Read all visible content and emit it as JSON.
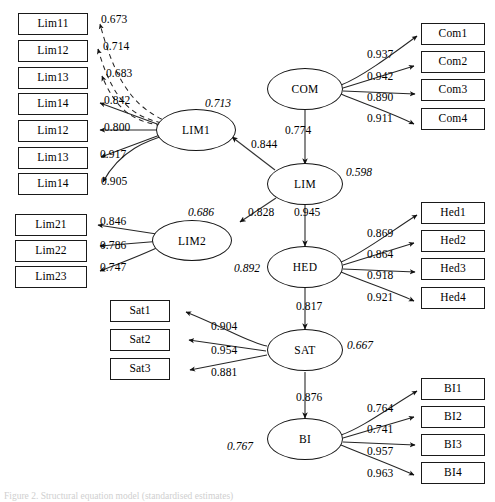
{
  "figure": {
    "type": "structural-equation-model",
    "caption": "Figure 2. Structural equation model (standardised estimates)"
  },
  "left_indicators_lim1": [
    {
      "label": "Lim11",
      "loading": "0.673"
    },
    {
      "label": "Lim12",
      "loading": "0.714"
    },
    {
      "label": "Lim13",
      "loading": "0.683"
    },
    {
      "label": "Lim14",
      "loading": "0.842"
    },
    {
      "label": "Lim12",
      "loading": "0.800"
    },
    {
      "label": "Lim13",
      "loading": "0.917"
    },
    {
      "label": "Lim14",
      "loading": "0.905"
    }
  ],
  "left_indicators_lim2": [
    {
      "label": "Lim21",
      "loading": "0.846"
    },
    {
      "label": "Lim22",
      "loading": "0.786"
    },
    {
      "label": "Lim23",
      "loading": "0.747"
    }
  ],
  "left_indicators_sat": [
    {
      "label": "Sat1",
      "loading": "0.904"
    },
    {
      "label": "Sat2",
      "loading": "0.954"
    },
    {
      "label": "Sat3",
      "loading": "0.881"
    }
  ],
  "right_indicators_com": [
    {
      "label": "Com1",
      "loading": "0.937"
    },
    {
      "label": "Com2",
      "loading": "0.942"
    },
    {
      "label": "Com3",
      "loading": "0.890"
    },
    {
      "label": "Com4",
      "loading": "0.911"
    }
  ],
  "right_indicators_hed": [
    {
      "label": "Hed1",
      "loading": "0.869"
    },
    {
      "label": "Hed2",
      "loading": "0.864"
    },
    {
      "label": "Hed3",
      "loading": "0.918"
    },
    {
      "label": "Hed4",
      "loading": "0.921"
    }
  ],
  "right_indicators_bi": [
    {
      "label": "BI1",
      "loading": "0.764"
    },
    {
      "label": "BI2",
      "loading": "0.741"
    },
    {
      "label": "BI3",
      "loading": "0.957"
    },
    {
      "label": "BI4",
      "loading": "0.963"
    }
  ],
  "latents": {
    "lim1": {
      "label": "LIM1",
      "r2": "0.713"
    },
    "lim2": {
      "label": "LIM2",
      "r2": "0.686"
    },
    "com": {
      "label": "COM",
      "r2": ""
    },
    "lim": {
      "label": "LIM",
      "r2": "0.598"
    },
    "hed": {
      "label": "HED",
      "r2": "0.892"
    },
    "sat": {
      "label": "SAT",
      "r2": "0.667"
    },
    "bi": {
      "label": "BI",
      "r2": "0.767"
    }
  },
  "structural_paths": [
    {
      "from": "COM",
      "to": "LIM",
      "coefficient": "0.774"
    },
    {
      "from": "LIM",
      "to": "LIM1",
      "coefficient": "0.844"
    },
    {
      "from": "LIM",
      "to": "LIM2",
      "coefficient": "0.828"
    },
    {
      "from": "LIM",
      "to": "HED",
      "coefficient": "0.945"
    },
    {
      "from": "HED",
      "to": "SAT",
      "coefficient": "0.817"
    },
    {
      "from": "SAT",
      "to": "BI",
      "coefficient": "0.876"
    }
  ],
  "colors": {
    "stroke": "#1a1a1a",
    "background": "#ffffff"
  }
}
